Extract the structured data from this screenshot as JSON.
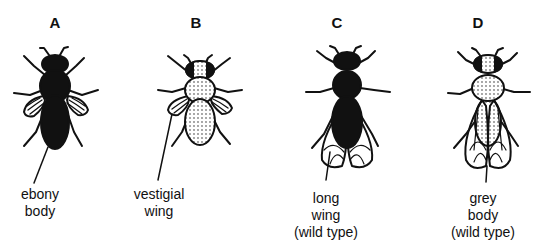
{
  "figure": {
    "flies": [
      {
        "id": "A",
        "letter": "A",
        "caption_line1": "ebony",
        "caption_line2": "body",
        "caption_line3": "",
        "body": "black",
        "wings": "vestigial"
      },
      {
        "id": "B",
        "letter": "B",
        "caption_line1": "vestigial",
        "caption_line2": "wing",
        "caption_line3": "",
        "body": "grey",
        "wings": "vestigial"
      },
      {
        "id": "C",
        "letter": "C",
        "caption_line1": "long",
        "caption_line2": "wing",
        "caption_line3": "(wild type)",
        "body": "black",
        "wings": "long"
      },
      {
        "id": "D",
        "letter": "D",
        "caption_line1": "grey",
        "caption_line2": "body",
        "caption_line3": "(wild type)",
        "body": "grey",
        "wings": "long"
      }
    ]
  },
  "colors": {
    "ink": "#111111",
    "background": "#ffffff"
  }
}
